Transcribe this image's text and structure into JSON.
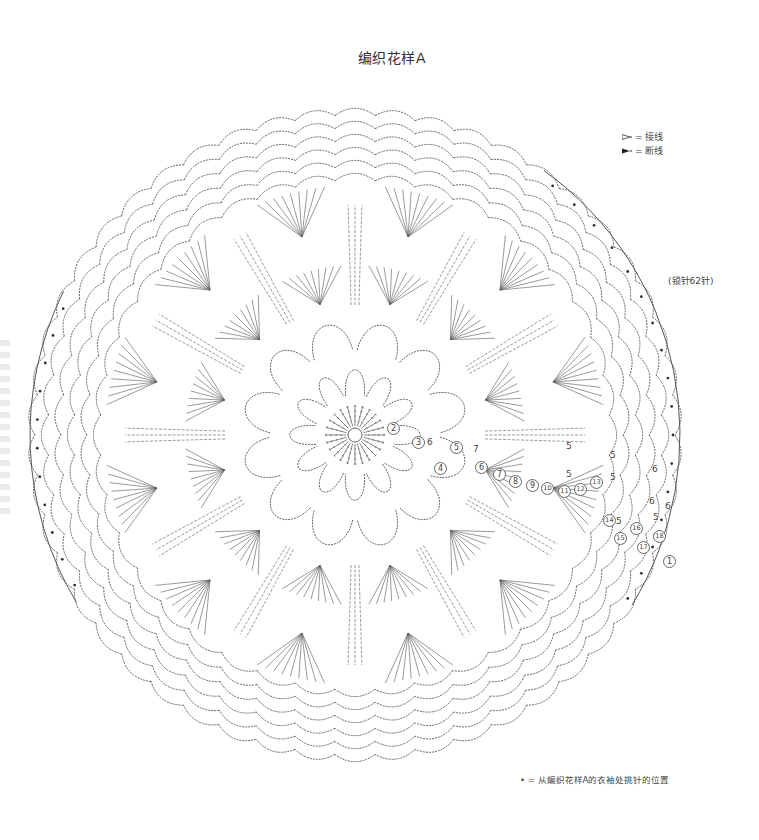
{
  "title": "编织花样A",
  "legend": {
    "items": [
      {
        "icon": "open-arrow",
        "label": "= 接线"
      },
      {
        "icon": "filled-arrow",
        "label": "= 断线"
      }
    ]
  },
  "side_note": "(锁针62针)",
  "foot_note": "• = 从编织花样A的衣袖处挑针的位置",
  "chart": {
    "shape": "circle",
    "center": [
      355,
      435
    ],
    "outer_radius": 330,
    "repeats": 12,
    "line_color": "#555555",
    "round_labels": [
      {
        "text": "1",
        "x": 669,
        "y": 561
      },
      {
        "text": "2",
        "x": 393,
        "y": 428
      },
      {
        "text": "3",
        "x": 418,
        "y": 442
      },
      {
        "text": "4",
        "x": 440,
        "y": 468
      },
      {
        "text": "5",
        "x": 456,
        "y": 447
      },
      {
        "text": "6",
        "x": 481,
        "y": 467
      },
      {
        "text": "7",
        "x": 499,
        "y": 474
      },
      {
        "text": "8",
        "x": 515,
        "y": 481
      },
      {
        "text": "9",
        "x": 532,
        "y": 485
      },
      {
        "text": "10",
        "x": 547,
        "y": 488
      },
      {
        "text": "11",
        "x": 564,
        "y": 491
      },
      {
        "text": "12",
        "x": 580,
        "y": 489
      },
      {
        "text": "13",
        "x": 596,
        "y": 482
      },
      {
        "text": "14",
        "x": 609,
        "y": 520
      },
      {
        "text": "15",
        "x": 620,
        "y": 538
      },
      {
        "text": "16",
        "x": 636,
        "y": 528
      },
      {
        "text": "17",
        "x": 643,
        "y": 547
      },
      {
        "text": "18",
        "x": 659,
        "y": 536
      }
    ],
    "chain_counts": [
      {
        "text": "6",
        "x": 430,
        "y": 443
      },
      {
        "text": "7",
        "x": 476,
        "y": 450
      },
      {
        "text": "5",
        "x": 569,
        "y": 447
      },
      {
        "text": "5",
        "x": 613,
        "y": 456
      },
      {
        "text": "5",
        "x": 569,
        "y": 475
      },
      {
        "text": "5",
        "x": 613,
        "y": 478
      },
      {
        "text": "6",
        "x": 655,
        "y": 470
      },
      {
        "text": "6",
        "x": 652,
        "y": 502
      },
      {
        "text": "6",
        "x": 668,
        "y": 507
      },
      {
        "text": "5",
        "x": 619,
        "y": 522
      },
      {
        "text": "5",
        "x": 656,
        "y": 518
      }
    ]
  }
}
